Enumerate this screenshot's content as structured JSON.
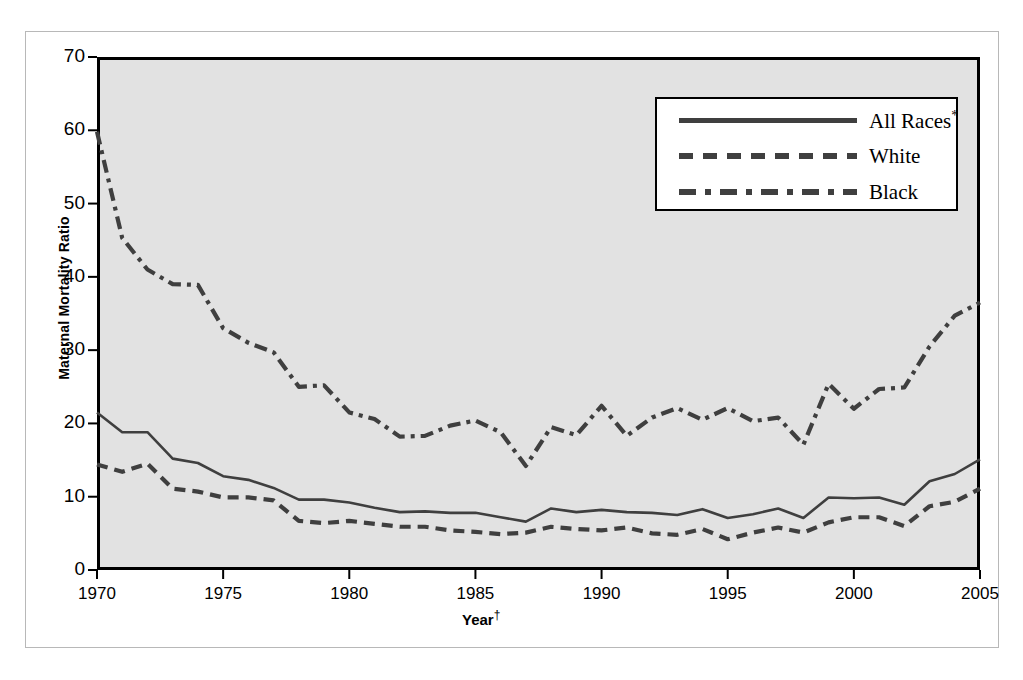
{
  "chart_data": {
    "type": "line",
    "title": "",
    "xlabel": "Year",
    "xlabel_marker": "†",
    "ylabel": "Maternal Mortality Ratio",
    "xlim": [
      1970,
      2005
    ],
    "ylim": [
      0,
      70
    ],
    "ytick_labels": [
      "0",
      "10",
      "20",
      "30",
      "40",
      "50",
      "60",
      "70"
    ],
    "ytick_values": [
      0,
      10,
      20,
      30,
      40,
      50,
      60,
      70
    ],
    "xtick_labels": [
      "1970",
      "1975",
      "1980",
      "1985",
      "1990",
      "1995",
      "2000",
      "2005"
    ],
    "xtick_values": [
      1970,
      1975,
      1980,
      1985,
      1990,
      1995,
      2000,
      2005
    ],
    "grid": false,
    "legend_position": "top-right",
    "x": [
      1970,
      1971,
      1972,
      1973,
      1974,
      1975,
      1976,
      1977,
      1978,
      1979,
      1980,
      1981,
      1982,
      1983,
      1984,
      1985,
      1986,
      1987,
      1988,
      1989,
      1990,
      1991,
      1992,
      1993,
      1994,
      1995,
      1996,
      1997,
      1998,
      1999,
      2000,
      2001,
      2002,
      2003,
      2004,
      2005
    ],
    "series": [
      {
        "name": "All Races *",
        "style": "solid",
        "color": "#3f3f3f",
        "values": [
          21.5,
          18.8,
          18.8,
          15.2,
          14.6,
          12.8,
          12.3,
          11.2,
          9.6,
          9.6,
          9.2,
          8.5,
          7.9,
          8.0,
          7.8,
          7.8,
          7.2,
          6.6,
          8.4,
          7.9,
          8.2,
          7.9,
          7.8,
          7.5,
          8.3,
          7.1,
          7.6,
          8.4,
          7.1,
          9.9,
          9.8,
          9.9,
          8.9,
          12.1,
          13.1,
          15.1
        ]
      },
      {
        "name": "White",
        "style": "dashed",
        "color": "#3f3f3f",
        "values": [
          14.4,
          13.4,
          14.5,
          11.1,
          10.7,
          9.9,
          9.9,
          9.5,
          6.7,
          6.4,
          6.7,
          6.3,
          5.9,
          5.9,
          5.4,
          5.2,
          4.9,
          5.1,
          5.9,
          5.6,
          5.4,
          5.8,
          5.0,
          4.8,
          5.6,
          4.2,
          5.1,
          5.8,
          5.1,
          6.5,
          7.2,
          7.2,
          6.0,
          8.7,
          9.3,
          11.1
        ]
      },
      {
        "name": "Black",
        "style": "dash-dot",
        "color": "#3f3f3f",
        "values": [
          59.8,
          45.3,
          41.0,
          39.0,
          38.9,
          33.0,
          31.0,
          29.7,
          25.0,
          25.2,
          21.5,
          20.6,
          18.2,
          18.3,
          19.7,
          20.4,
          18.8,
          14.2,
          19.5,
          18.4,
          22.4,
          18.3,
          20.8,
          22.1,
          20.5,
          22.1,
          20.3,
          20.8,
          17.1,
          25.4,
          22.0,
          24.7,
          24.9,
          30.5,
          34.7,
          36.5
        ]
      }
    ]
  },
  "axes": {
    "y_ticks": [
      {
        "label": "70",
        "value": 70
      },
      {
        "label": "60",
        "value": 60
      },
      {
        "label": "50",
        "value": 50
      },
      {
        "label": "40",
        "value": 40
      },
      {
        "label": "30",
        "value": 30
      },
      {
        "label": "20",
        "value": 20
      },
      {
        "label": "10",
        "value": 10
      },
      {
        "label": "0",
        "value": 0
      }
    ],
    "x_ticks": [
      {
        "label": "1970",
        "value": 1970
      },
      {
        "label": "1975",
        "value": 1975
      },
      {
        "label": "1980",
        "value": 1980
      },
      {
        "label": "1985",
        "value": 1985
      },
      {
        "label": "1990",
        "value": 1990
      },
      {
        "label": "1995",
        "value": 1995
      },
      {
        "label": "2000",
        "value": 2000
      },
      {
        "label": "2005",
        "value": 2005
      }
    ],
    "y_title": "Maternal Mortality Ratio",
    "x_title": "Year",
    "x_title_marker": "†"
  },
  "legend": {
    "entries": [
      {
        "label": "All Races",
        "marker": "*",
        "style": "solid"
      },
      {
        "label": "White",
        "marker": "",
        "style": "dashed"
      },
      {
        "label": "Black",
        "marker": "",
        "style": "dash-dot"
      }
    ]
  },
  "colors": {
    "plot_background": "#e2e2e2",
    "line": "#3f3f3f",
    "frame": "#000000",
    "outer_frame": "#b8b8b8",
    "legend_background": "#ffffff"
  }
}
